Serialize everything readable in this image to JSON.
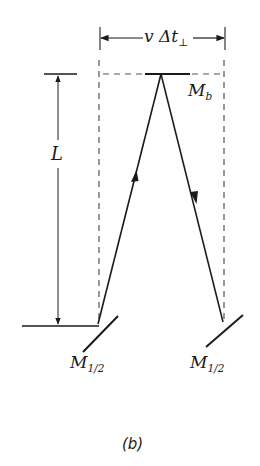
{
  "diagram": {
    "type": "light-clock mirror path diagram",
    "panel_label": "(b)",
    "dimension_top": {
      "text": "v Δt",
      "subscript": "⊥"
    },
    "dimension_left": {
      "text": "L"
    },
    "mirrors": [
      {
        "id": "top",
        "label": "M",
        "subscript": "b"
      },
      {
        "id": "bottom-left",
        "label": "M",
        "subscript": "1/2"
      },
      {
        "id": "bottom-right",
        "label": "M",
        "subscript": "1/2"
      }
    ],
    "rays": [
      {
        "from": "bottom-left",
        "to": "top",
        "arrow": "up"
      },
      {
        "from": "top",
        "to": "bottom-right",
        "arrow": "down"
      }
    ],
    "colors": {
      "ink": "#1a1a1a",
      "dashed": "#555555",
      "background": "#ffffff"
    }
  }
}
